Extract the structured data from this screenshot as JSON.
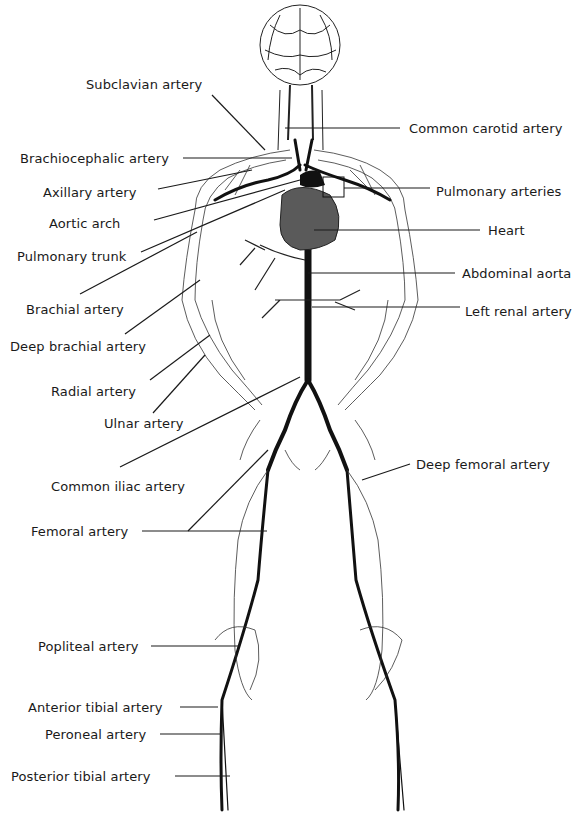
{
  "diagram": {
    "labels_left": [
      {
        "id": "subclavian",
        "text": "Subclavian artery"
      },
      {
        "id": "brachiocephalic",
        "text": "Brachiocephalic artery"
      },
      {
        "id": "axillary",
        "text": "Axillary artery"
      },
      {
        "id": "aortic_arch",
        "text": "Aortic arch"
      },
      {
        "id": "pulmonary_trunk",
        "text": "Pulmonary trunk"
      },
      {
        "id": "brachial",
        "text": "Brachial artery"
      },
      {
        "id": "deep_brachial",
        "text": "Deep brachial artery"
      },
      {
        "id": "radial",
        "text": "Radial artery"
      },
      {
        "id": "ulnar",
        "text": "Ulnar artery"
      },
      {
        "id": "common_iliac",
        "text": "Common iliac artery"
      },
      {
        "id": "femoral",
        "text": "Femoral artery"
      },
      {
        "id": "popliteal",
        "text": "Popliteal artery"
      },
      {
        "id": "anterior_tibial",
        "text": "Anterior tibial artery"
      },
      {
        "id": "peroneal",
        "text": "Peroneal artery"
      },
      {
        "id": "posterior_tibial",
        "text": "Posterior tibial artery"
      }
    ],
    "labels_right": [
      {
        "id": "common_carotid",
        "text": "Common carotid artery"
      },
      {
        "id": "pulmonary_arteries",
        "text": "Pulmonary arteries"
      },
      {
        "id": "heart",
        "text": "Heart"
      },
      {
        "id": "abdominal_aorta",
        "text": "Abdominal aorta"
      },
      {
        "id": "left_renal",
        "text": "Left renal artery"
      },
      {
        "id": "deep_femoral",
        "text": "Deep femoral artery"
      }
    ],
    "colors": {
      "background": "#ffffff",
      "text": "#1a1a1a",
      "leader_line": "#1a1a1a",
      "vessel": "#111111",
      "heart": "#5a5a5a"
    }
  }
}
